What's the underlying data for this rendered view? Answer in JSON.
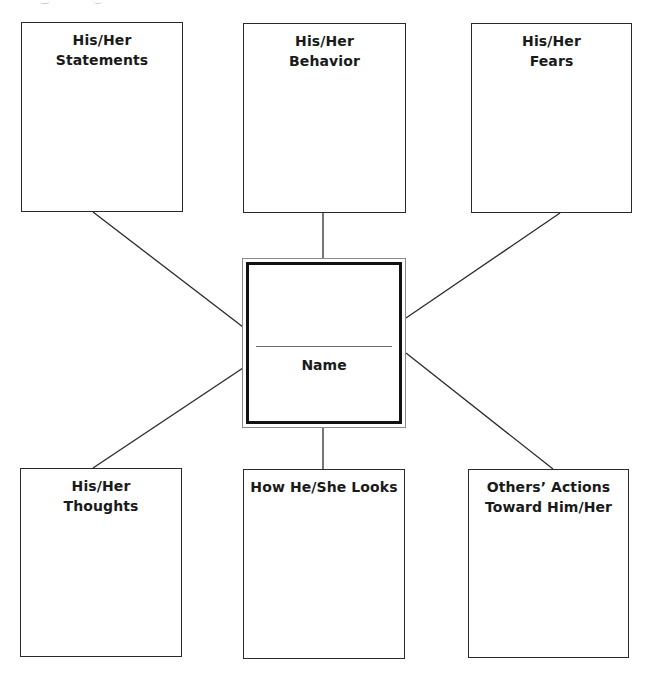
{
  "diagram": {
    "type": "character-map",
    "center": {
      "label": "Name",
      "name_line": "blank"
    },
    "boxes": [
      {
        "id": "statements",
        "position": "top-left",
        "lines": [
          "His/Her",
          "Statements"
        ]
      },
      {
        "id": "behavior",
        "position": "top-center",
        "lines": [
          "His/Her",
          "Behavior"
        ]
      },
      {
        "id": "fears",
        "position": "top-right",
        "lines": [
          "His/Her",
          "Fears"
        ]
      },
      {
        "id": "thoughts",
        "position": "bottom-left",
        "lines": [
          "His/Her",
          "Thoughts"
        ]
      },
      {
        "id": "looks",
        "position": "bottom-center",
        "lines": [
          "How He/She Looks"
        ]
      },
      {
        "id": "others-actions",
        "position": "bottom-right",
        "lines": [
          "Others’ Actions",
          "Toward Him/Her"
        ]
      }
    ],
    "colors": {
      "line": "#2a2a2a",
      "center_outer_border": "#8a8a8a",
      "center_inner_border": "#111111",
      "name_rule": "#6a6a6a",
      "background": "#ffffff"
    }
  }
}
